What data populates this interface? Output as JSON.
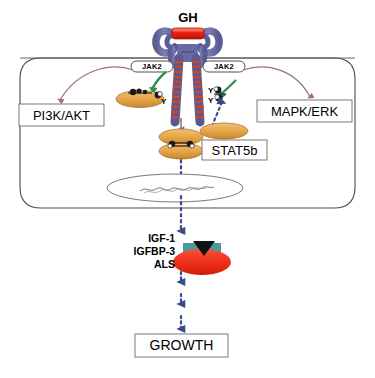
{
  "figure": {
    "caption": ""
  },
  "labels": {
    "gh": "GH",
    "jak2_left": "JAK2",
    "jak2_right": "JAK2",
    "pi3k_akt": "PI3K/AKT",
    "mapk_erk": "MAPK/ERK",
    "stat5b": "STAT5b",
    "igf1": "IGF-1",
    "igfbp3": "IGFBP-3",
    "als": "ALS",
    "growth": "GROWTH",
    "tyrosine_1": "Y",
    "tyrosine_2": "Y",
    "tyrosine_3": "Y"
  },
  "colors": {
    "gh_ligand": "#ee2211",
    "receptor_body": "#6f6fa8",
    "receptor_stripe": "#d4451f",
    "membrane_outline": "#4a4a4a",
    "arrow_mauve": "#9b6b8e",
    "arrow_green": "#2f8f4e",
    "arrow_blue": "#3a4a8c",
    "stat_oval": "#e3a44a",
    "igf_complex": "#ee2d1a",
    "igf_teal": "#4e9a9a",
    "box_border": "#6b6b6b",
    "nucleus_outline": "#555555"
  },
  "shapes": {
    "cell_membrane": "rounded-rectangle",
    "nucleus": "ellipse-with-dna",
    "stat5b_monomer": "ellipse",
    "stat5b_dimer": "stacked-ellipses",
    "igf_ternary_complex": "ellipse-with-blocks"
  }
}
